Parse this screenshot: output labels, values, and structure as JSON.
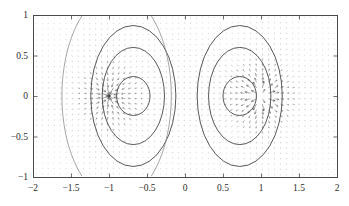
{
  "figure": {
    "kind": "quiver-with-contours",
    "background": "#ffffff",
    "axis_color": "#4a4a4a",
    "arrow_color": "#2b2b2b",
    "contour_color": "#3a3a3a",
    "contour_faint_color": "#8e8e8e"
  },
  "chart_data": {
    "type": "scatter",
    "title": "",
    "subtitle": "",
    "xlabel": "",
    "ylabel": "",
    "xlim": [
      -2,
      2
    ],
    "ylim": [
      -1,
      1
    ],
    "grid": false,
    "legend": "none",
    "xticks": [
      -2,
      -1.5,
      -1,
      -0.5,
      0,
      0.5,
      1,
      1.5,
      2
    ],
    "xtick_labels": [
      "-2",
      "-1.5",
      "-1",
      "-0.5",
      "0",
      "0.5",
      "1",
      "1.5",
      "2"
    ],
    "yticks": [
      -1,
      -0.5,
      0,
      0.5,
      1
    ],
    "ytick_labels": [
      "-1",
      "-0.5",
      "0",
      "0.5",
      "1"
    ],
    "field": {
      "description": "2-D vector field of a dipole pair: sink at x=-1, source at x=+1 on the y=0 axis; arrows are gradient directions, longest and horizontal near x=0.",
      "sources": [
        {
          "x": -1.0,
          "y": 0.0,
          "sign": -1
        },
        {
          "x": 1.0,
          "y": 0.0,
          "sign": 1
        }
      ],
      "grid_nx": 51,
      "grid_ny": 30,
      "max_arrow_px": 7.0
    },
    "contours": {
      "levels_left": [
        {
          "cx": -0.68,
          "cy": 0.0,
          "rx": 0.22,
          "ry": 0.24,
          "weight": "normal"
        },
        {
          "cx": -0.68,
          "cy": 0.0,
          "rx": 0.41,
          "ry": 0.6,
          "weight": "normal"
        },
        {
          "cx": -0.68,
          "cy": 0.0,
          "rx": 0.56,
          "ry": 0.87,
          "weight": "normal"
        },
        {
          "cx": -0.9,
          "cy": 0.0,
          "rx": 0.72,
          "ry": 1.28,
          "weight": "faint"
        }
      ],
      "levels_right": [
        {
          "cx": 0.72,
          "cy": 0.0,
          "rx": 0.22,
          "ry": 0.24,
          "weight": "normal"
        },
        {
          "cx": 0.72,
          "cy": 0.0,
          "rx": 0.41,
          "ry": 0.6,
          "weight": "normal"
        },
        {
          "cx": 0.72,
          "cy": 0.0,
          "rx": 0.56,
          "ry": 0.87,
          "weight": "normal"
        }
      ]
    }
  },
  "geometry": {
    "plot_left": 33,
    "plot_top": 15,
    "plot_right": 337,
    "plot_bottom": 177
  }
}
